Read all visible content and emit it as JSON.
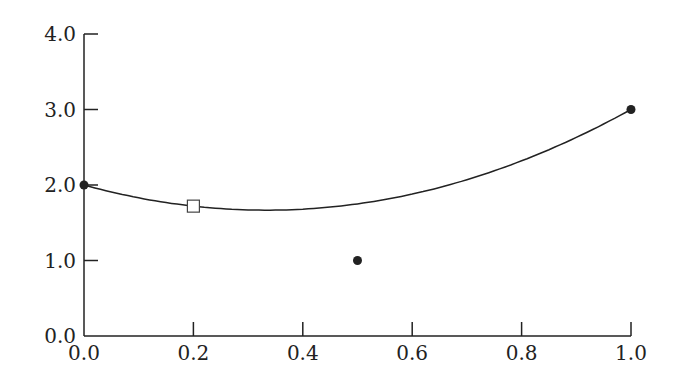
{
  "chart_data": {
    "type": "scatter",
    "title": "",
    "xlabel": "",
    "ylabel": "",
    "xlim": [
      0.0,
      1.0
    ],
    "ylim": [
      0.0,
      4.0
    ],
    "grid": false,
    "x_ticks": [
      "0.0",
      "0.2",
      "0.4",
      "0.6",
      "0.8",
      "1.0"
    ],
    "y_ticks": [
      "0.0",
      "1.0",
      "2.0",
      "3.0",
      "4.0"
    ],
    "series": [
      {
        "name": "data points",
        "marker": "filled-circle",
        "points": [
          {
            "x": 0.0,
            "y": 2.0
          },
          {
            "x": 0.5,
            "y": 1.0
          },
          {
            "x": 1.0,
            "y": 3.0
          }
        ]
      },
      {
        "name": "fitted curve",
        "type": "line",
        "equation": "y = 2 - 2x + 3x^2",
        "x": [
          0.0,
          0.1,
          0.2,
          0.3,
          0.4,
          0.5,
          0.6,
          0.7,
          0.8,
          0.9,
          1.0
        ],
        "values": [
          2.0,
          1.83,
          1.72,
          1.67,
          1.68,
          1.75,
          1.88,
          2.07,
          2.32,
          2.63,
          3.0
        ]
      },
      {
        "name": "evaluated point",
        "marker": "open-square",
        "points": [
          {
            "x": 0.2,
            "y": 1.72
          }
        ]
      }
    ]
  }
}
